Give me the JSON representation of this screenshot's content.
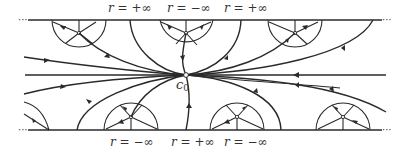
{
  "diagram": {
    "type": "phase-portrait / flow-lines in strip",
    "center_point": {
      "label": "c",
      "subscript": "0"
    },
    "top_labels": [
      {
        "var": "r",
        "eq": " = +∞"
      },
      {
        "var": "r",
        "eq": " = −∞"
      },
      {
        "var": "r",
        "eq": " = +∞"
      }
    ],
    "bottom_labels": [
      {
        "var": "r",
        "eq": " = −∞"
      },
      {
        "var": "r",
        "eq": " = +∞"
      },
      {
        "var": "r",
        "eq": " = −∞"
      }
    ],
    "ellipsis": "···",
    "colors": {
      "stroke": "#2a2a2a",
      "background": "#ffffff"
    }
  }
}
